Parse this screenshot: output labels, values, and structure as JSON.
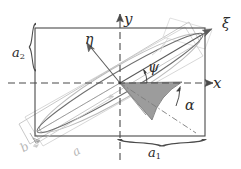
{
  "figure": {
    "background_color": "#ffffff",
    "axes": {
      "x_axis_label": "x",
      "y_axis_label": "y",
      "xi_axis_label": "ξ",
      "eta_axis_label": "η",
      "axis_style": "dashed",
      "axis_color": "#4a4a4a",
      "rotated_axis_color": "#7d7d7d"
    },
    "angles": [
      {
        "name": "psi",
        "label": "ψ",
        "description": "angle between x-axis and wedge upper edge",
        "color": "#2b2b2b"
      },
      {
        "name": "alpha",
        "label": "α",
        "description": "angle of shaded wedge",
        "color": "#2b2b2b"
      }
    ],
    "dimensions": [
      {
        "name": "a1",
        "label": "a",
        "subscript": "1",
        "description": "half-width of outer rectangle, measured along x from origin",
        "position": "bottom"
      },
      {
        "name": "a2",
        "label": "a",
        "subscript": "2",
        "description": "half-height of outer rectangle, measured along y from origin",
        "position": "left"
      },
      {
        "name": "a",
        "label": "a",
        "subscript": "",
        "description": "semi-major axis of rotated ellipse",
        "position": "bottom-left-rotated"
      },
      {
        "name": "b",
        "label": "b",
        "subscript": "",
        "description": "semi-minor axis of rotated ellipse",
        "position": "bottom-left-rotated"
      }
    ],
    "shapes": {
      "outer_rectangle": {
        "name": "outer-rectangle",
        "stroke": "#4a4a4a",
        "fill": "none"
      },
      "tilted_rectangle": {
        "name": "tilted-rectangle",
        "stroke": "#c2c2c2",
        "fill": "none"
      },
      "tilted_rectangle_secondary": {
        "name": "tilted-rectangle-secondary",
        "stroke": "#cfcfcf",
        "fill": "none"
      },
      "ellipse_dark": {
        "name": "ellipse-dark",
        "stroke": "#6f6f6f",
        "fill": "none"
      },
      "ellipse_light": {
        "name": "ellipse-light",
        "stroke": "#b8b8b8",
        "fill": "none"
      },
      "shaded_wedge": {
        "name": "shaded-wedge",
        "fill": "#9c9c9c",
        "stroke": "#6a6a6a"
      }
    },
    "braces": {
      "a1_brace_color": "#4a4a4a",
      "a2_brace_color": "#4a4a4a",
      "a_brace_color": "#bdbdbd",
      "b_brace_color": "#9e9e9e"
    }
  }
}
